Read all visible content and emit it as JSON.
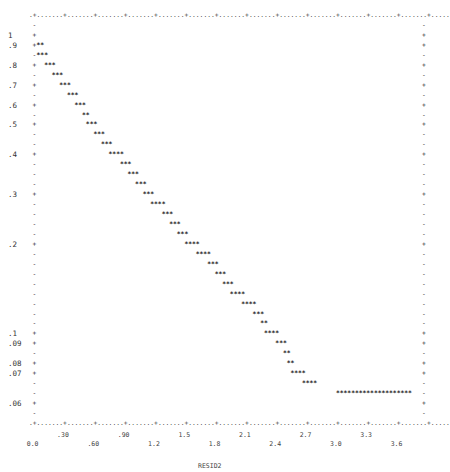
{
  "chart_data": {
    "type": "scatter",
    "style": "line-printer plot (asterisk characters)",
    "title": "",
    "xlabel": "RESID2",
    "ylabel": "",
    "x_ticks": [
      "0.0",
      ".30",
      ".60",
      ".90",
      "1.2",
      "1.5",
      "1.8",
      "2.1",
      "2.4",
      "2.7",
      "3.0",
      "3.3",
      "3.6"
    ],
    "y_ticks": [
      "1",
      ".9",
      ".8",
      ".7",
      ".6",
      ".5",
      ".4",
      ".3",
      ".2",
      ".1",
      ".09",
      ".08",
      ".07",
      ".06"
    ],
    "xlim": [
      0.0,
      3.6
    ],
    "y_scale": "log",
    "ylim": [
      0.055,
      1.05
    ],
    "grid": false,
    "legend": null,
    "points_description": "Monotonically decreasing curve, roughly linear on log scale, from y≈0.9 at x≈0 down to y≈0.06 at x≈2.9, then flat at y≈0.06 from x≈2.9 to x≈3.5",
    "series": [
      {
        "name": "RESID2 curve",
        "x": [
          0.02,
          0.06,
          0.17,
          0.27,
          0.36,
          0.45,
          0.54,
          0.63,
          0.69,
          0.78,
          0.87,
          0.99,
          1.08,
          1.17,
          1.26,
          1.35,
          1.47,
          1.56,
          1.65,
          1.74,
          1.86,
          1.98,
          2.07,
          2.16,
          2.25,
          2.37,
          2.49,
          2.58,
          2.64,
          2.73,
          2.82,
          2.88,
          2.91,
          2.97,
          3.09,
          3.2
        ],
        "y": [
          0.9,
          0.85,
          0.8,
          0.75,
          0.7,
          0.65,
          0.6,
          0.55,
          0.5,
          0.47,
          0.44,
          0.4,
          0.37,
          0.35,
          0.33,
          0.3,
          0.28,
          0.26,
          0.24,
          0.22,
          0.2,
          0.185,
          0.17,
          0.16,
          0.145,
          0.135,
          0.125,
          0.115,
          0.1,
          0.09,
          0.085,
          0.08,
          0.07,
          0.067,
          0.063,
          0.06
        ]
      }
    ]
  },
  "plot": {
    "top_border": ".+.......+.......+.......+.......+.......+.......+.......+.......+.......+.......+.......+.......+.......+.....",
    "bottom_border": ".+.......+.......+.......+.......+.......+.......+.......+.......+.......+.......+.......+.......+.......+.....",
    "left_axis": [
      "-",
      "+",
      "+",
      "-",
      "+",
      "-",
      "+",
      "-",
      "+",
      "-",
      "+",
      "-",
      "-",
      "+",
      "-",
      "-",
      "-",
      "+",
      "-",
      "-",
      "-",
      "-",
      "+",
      "-",
      "-",
      "-",
      "-",
      "-",
      "-",
      "-",
      "-",
      "+",
      "+",
      "-",
      "+",
      "+",
      "-",
      "-",
      "+",
      "-"
    ],
    "y_labels": [
      {
        "row": 2,
        "text": "1"
      },
      {
        "row": 3,
        "text": ".9"
      },
      {
        "row": 5,
        "text": ".8"
      },
      {
        "row": 7,
        "text": ".7"
      },
      {
        "row": 9,
        "text": ".6"
      },
      {
        "row": 11,
        "text": ".5"
      },
      {
        "row": 14,
        "text": ".4"
      },
      {
        "row": 18,
        "text": ".3"
      },
      {
        "row": 23,
        "text": ".2"
      },
      {
        "row": 32,
        "text": ".1"
      },
      {
        "row": 33,
        "text": ".09"
      },
      {
        "row": 35,
        "text": ".08"
      },
      {
        "row": 36,
        "text": ".07"
      },
      {
        "row": 39,
        "text": ".06"
      }
    ],
    "star_rows": [
      {
        "row": 3,
        "col": 2,
        "text": "**"
      },
      {
        "row": 4,
        "col": 2,
        "text": "***"
      },
      {
        "row": 5,
        "col": 4,
        "text": "***"
      },
      {
        "row": 6,
        "col": 6,
        "text": "***"
      },
      {
        "row": 7,
        "col": 8,
        "text": "***"
      },
      {
        "row": 8,
        "col": 10,
        "text": "***"
      },
      {
        "row": 9,
        "col": 12,
        "text": "***"
      },
      {
        "row": 10,
        "col": 14,
        "text": "**"
      },
      {
        "row": 11,
        "col": 15,
        "text": "***"
      },
      {
        "row": 12,
        "col": 17,
        "text": "***"
      },
      {
        "row": 13,
        "col": 19,
        "text": "***"
      },
      {
        "row": 14,
        "col": 21,
        "text": "****"
      },
      {
        "row": 15,
        "col": 24,
        "text": "***"
      },
      {
        "row": 16,
        "col": 26,
        "text": "***"
      },
      {
        "row": 17,
        "col": 28,
        "text": "***"
      },
      {
        "row": 18,
        "col": 30,
        "text": "***"
      },
      {
        "row": 19,
        "col": 32,
        "text": "****"
      },
      {
        "row": 20,
        "col": 35,
        "text": "***"
      },
      {
        "row": 21,
        "col": 37,
        "text": "***"
      },
      {
        "row": 22,
        "col": 39,
        "text": "***"
      },
      {
        "row": 23,
        "col": 41,
        "text": "****"
      },
      {
        "row": 24,
        "col": 44,
        "text": "****"
      },
      {
        "row": 25,
        "col": 47,
        "text": "***"
      },
      {
        "row": 26,
        "col": 49,
        "text": "***"
      },
      {
        "row": 27,
        "col": 51,
        "text": "***"
      },
      {
        "row": 28,
        "col": 53,
        "text": "****"
      },
      {
        "row": 29,
        "col": 56,
        "text": "****"
      },
      {
        "row": 30,
        "col": 59,
        "text": "***"
      },
      {
        "row": 31,
        "col": 61,
        "text": "**"
      },
      {
        "row": 32,
        "col": 62,
        "text": "****"
      },
      {
        "row": 33,
        "col": 65,
        "text": "***"
      },
      {
        "row": 34,
        "col": 67,
        "text": "**"
      },
      {
        "row": 35,
        "col": 68,
        "text": "**"
      },
      {
        "row": 36,
        "col": 69,
        "text": "****"
      },
      {
        "row": 37,
        "col": 72,
        "text": "****"
      },
      {
        "row": 38,
        "col": 81,
        "text": "********************"
      }
    ]
  }
}
